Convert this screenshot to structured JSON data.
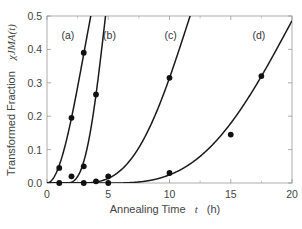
{
  "chart_data": {
    "type": "scatter",
    "title": "",
    "xlabel": "Annealing Time",
    "xlabel_var": "t",
    "xlabel_unit": "(h)",
    "ylabel": "Transformed Fraction",
    "ylabel_var": "χJMA(t)",
    "xlim": [
      0,
      20
    ],
    "ylim": [
      0,
      0.5
    ],
    "x_ticks": [
      "0",
      "5",
      "10",
      "15",
      "20"
    ],
    "y_ticks": [
      "0.0",
      "0.1",
      "0.2",
      "0.3",
      "0.4",
      "0.5"
    ],
    "grid": false,
    "series": [
      {
        "name": "(a)",
        "points": [
          [
            1.0,
            0.0
          ],
          [
            1.0,
            0.045
          ],
          [
            2.0,
            0.195
          ],
          [
            3.0,
            0.39
          ]
        ],
        "fit": {
          "model": "JMA",
          "n": 2,
          "k": 0.233,
          "t0": 0
        }
      },
      {
        "name": "(b)",
        "points": [
          [
            2.0,
            0.02
          ],
          [
            3.0,
            0.0
          ],
          [
            3.0,
            0.05
          ],
          [
            4.0,
            0.265
          ]
        ],
        "fit": {
          "model": "JMA",
          "n": 3,
          "k": 0.27,
          "t0": 1.5
        }
      },
      {
        "name": "(c)",
        "points": [
          [
            4.0,
            0.005
          ],
          [
            5.0,
            0.0
          ],
          [
            5.0,
            0.02
          ],
          [
            10.0,
            0.315
          ]
        ],
        "fit": {
          "model": "JMA",
          "n": 3,
          "k": 0.0964,
          "t0": 2.5
        }
      },
      {
        "name": "(d)",
        "points": [
          [
            10.0,
            0.03
          ],
          [
            15.0,
            0.145
          ],
          [
            17.5,
            0.32
          ]
        ],
        "fit": {
          "model": "JMA",
          "n": 3,
          "k": 0.0582,
          "t0": 5
        }
      }
    ],
    "series_label_positions": [
      [
        1.7,
        0.43
      ],
      [
        5.1,
        0.43
      ],
      [
        10.1,
        0.43
      ],
      [
        17.3,
        0.43
      ]
    ]
  }
}
